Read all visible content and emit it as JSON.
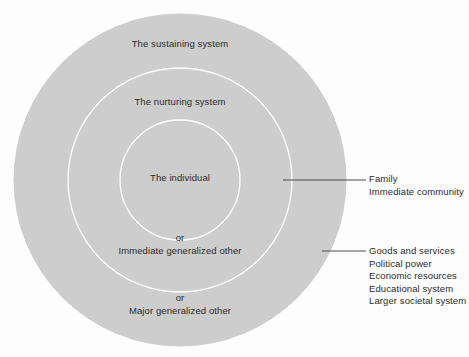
{
  "diagram": {
    "colors": {
      "ring_fill": "#cdcdcd",
      "ring_stroke": "#ffffff",
      "text": "#2b2b2b",
      "leader_line": "#3a3a3a",
      "background": "#fdfdfd"
    },
    "rings": {
      "outer": {
        "label": "The sustaining system",
        "alt_prefix": "or",
        "alt_label": "Major generalized other"
      },
      "middle": {
        "label": "The nurturing system",
        "alt_prefix": "or",
        "alt_label": "Immediate generalized other"
      },
      "inner": {
        "label": "The individual"
      }
    },
    "callouts": [
      {
        "target": "middle",
        "items": [
          "Family",
          "Immediate community"
        ]
      },
      {
        "target": "outer",
        "items": [
          "Goods and services",
          "Political power",
          "Economic resources",
          "Educational system",
          "Larger societal system"
        ]
      }
    ]
  }
}
